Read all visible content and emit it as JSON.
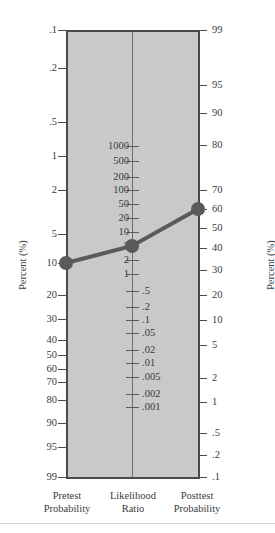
{
  "figure": {
    "kind": "fagan-nomogram",
    "background_color": "#ffffff",
    "panel_color": "#c9c9c9",
    "axis_color": "#4a4a4a",
    "plot_color": "#5a5a5a"
  },
  "axes": {
    "left_caption": "Percent (%)",
    "right_caption": "Percent (%)"
  },
  "columns": {
    "pretest": {
      "line1": "Pretest",
      "line2": "Probability"
    },
    "likelihood": {
      "line1": "Likelihood",
      "line2": "Ratio"
    },
    "posttest": {
      "line1": "Posttest",
      "line2": "Probability"
    }
  },
  "chart_data": {
    "type": "line",
    "title": "",
    "subtitle": "",
    "xlabel": "",
    "ylabel": "Percent (%)",
    "grid": false,
    "legend": "none",
    "scales": [
      {
        "name": "Pretest Probability",
        "side": "left",
        "unit": "Percent (%)",
        "tick_labels": [
          ".1",
          ".2",
          ".5",
          "1",
          "2",
          "5",
          "10",
          "20",
          "30",
          "40",
          "50",
          "60",
          "70",
          "80",
          "90",
          "95",
          "99"
        ],
        "tick_values": [
          0.1,
          0.2,
          0.5,
          1,
          2,
          5,
          10,
          20,
          30,
          40,
          50,
          60,
          70,
          80,
          90,
          95,
          99
        ],
        "tick_y": [
          30,
          68,
          122,
          156,
          190,
          234,
          263,
          295,
          319,
          340,
          355,
          369,
          382,
          400,
          423,
          447,
          477
        ],
        "direction": "increasing-downward"
      },
      {
        "name": "Likelihood Ratio",
        "side": "center",
        "unit": "ratio",
        "tick_labels": [
          "1000",
          "500",
          "200",
          "100",
          "50",
          "20",
          "10",
          "5",
          "2",
          "1",
          ".5",
          ".2",
          ".1",
          ".05",
          ".02",
          ".01",
          ".005",
          ".002",
          ".001"
        ],
        "tick_values": [
          1000,
          500,
          200,
          100,
          50,
          20,
          10,
          5,
          2,
          1,
          0.5,
          0.2,
          0.1,
          0.05,
          0.02,
          0.01,
          0.005,
          0.002,
          0.001
        ],
        "tick_y": [
          146,
          161,
          177,
          190,
          204,
          218,
          232,
          246,
          260,
          274,
          291,
          307,
          320,
          333,
          350,
          363,
          377,
          394,
          407
        ],
        "labels_left_of_axis": [
          "1000",
          "500",
          "200",
          "100",
          "50",
          "20",
          "10",
          "5",
          "2",
          "1"
        ],
        "labels_right_of_axis": [
          ".5",
          ".2",
          ".1",
          ".05",
          ".02",
          ".01",
          ".005",
          ".002",
          ".001"
        ],
        "direction": "decreasing-downward"
      },
      {
        "name": "Posttest Probability",
        "side": "right",
        "unit": "Percent (%)",
        "tick_labels": [
          "99",
          "95",
          "90",
          "80",
          "70",
          "60",
          "50",
          "40",
          "30",
          "20",
          "10",
          "5",
          "2",
          "1",
          ".5",
          ".2",
          ".1"
        ],
        "tick_values": [
          99,
          95,
          90,
          80,
          70,
          60,
          50,
          40,
          30,
          20,
          10,
          5,
          2,
          1,
          0.5,
          0.2,
          0.1
        ],
        "tick_y": [
          30,
          85,
          113,
          145,
          190,
          209,
          228,
          248,
          270,
          295,
          320,
          345,
          378,
          402,
          433,
          455,
          477
        ],
        "direction": "decreasing-downward"
      }
    ],
    "annotations": {
      "worked_example": {
        "description": "Straight line through pretest probability, likelihood ratio and posttest probability",
        "points": [
          {
            "scale": "Pretest Probability",
            "label": "30",
            "value": 30,
            "x": 66,
            "y": 263
          },
          {
            "scale": "Likelihood Ratio",
            "label": "5",
            "value": 5,
            "x": 132,
            "y": 246
          },
          {
            "scale": "Posttest Probability",
            "label": "65",
            "value": 65,
            "x": 198,
            "y": 209
          }
        ],
        "line_color": "#5a5a5a",
        "line_width": 4,
        "marker": "filled-circle",
        "marker_radius": 7
      }
    }
  }
}
